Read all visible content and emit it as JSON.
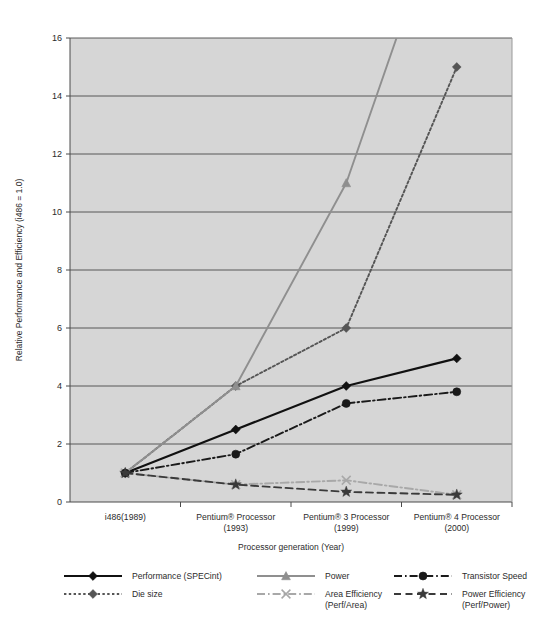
{
  "chart_data": {
    "type": "line",
    "title": "",
    "xlabel": "Processor generation (Year)",
    "ylabel": "Relative Performance and Efficiency (i486 = 1.0)",
    "categories": [
      "i486(1989)",
      "Pentium® Processor\n(1993)",
      "Pentium® 3 Processor\n(1999)",
      "Pentium® 4 Processor\n(2000)"
    ],
    "category_lines": [
      [
        "i486(1989)",
        ""
      ],
      [
        "Pentium® Processor",
        "(1993)"
      ],
      [
        "Pentium® 3 Processor",
        "(1999)"
      ],
      [
        "Pentium® 4 Processor",
        "(2000)"
      ]
    ],
    "ylim": [
      0,
      16
    ],
    "yticks": [
      0,
      2,
      4,
      6,
      8,
      10,
      12,
      14,
      16
    ],
    "grid": true,
    "legend_position": "bottom",
    "plot_background": "#d6d6d6",
    "series": [
      {
        "name": "Performance (SPECint)",
        "values": [
          1.0,
          2.5,
          4.0,
          4.95
        ],
        "color": "#111111",
        "style": "solid",
        "marker": "diamond"
      },
      {
        "name": "Die size",
        "values": [
          1.0,
          4.0,
          6.0,
          15.0
        ],
        "color": "#555555",
        "style": "dotted",
        "marker": "diamond"
      },
      {
        "name": "Power",
        "values": [
          1.0,
          4.0,
          11.0,
          22.0
        ],
        "color": "#8f8f8f",
        "style": "solid",
        "marker": "triangle"
      },
      {
        "name": "Area Efficiency (Perf/Area)",
        "label_lines": [
          "Area Efficiency",
          "(Perf/Area)"
        ],
        "values": [
          1.0,
          0.6,
          0.75,
          0.25
        ],
        "color": "#a8a8a8",
        "style": "dashdot",
        "marker": "x"
      },
      {
        "name": "Transistor Speed",
        "values": [
          1.0,
          1.65,
          3.4,
          3.8
        ],
        "color": "#1a1a1a",
        "style": "dashdot",
        "marker": "circle"
      },
      {
        "name": "Power Efficiency (Perf/Power)",
        "label_lines": [
          "Power Efficiency",
          "(Perf/Power)"
        ],
        "values": [
          1.0,
          0.6,
          0.35,
          0.25
        ],
        "color": "#3a3a3a",
        "style": "dashed",
        "marker": "star"
      }
    ]
  },
  "legend": {
    "items": [
      {
        "label": "Performance (SPECint)",
        "line2": ""
      },
      {
        "label": "Power",
        "line2": ""
      },
      {
        "label": "Transistor Speed",
        "line2": ""
      },
      {
        "label": "Die size",
        "line2": ""
      },
      {
        "label": "Area Efficiency",
        "line2": "(Perf/Area)"
      },
      {
        "label": "Power Efficiency",
        "line2": "(Perf/Power)"
      }
    ]
  },
  "axis": {
    "y_title": "Relative Performance and Efficiency (i486 = 1.0)",
    "x_title": "Processor generation (Year)",
    "ytick_0": "0",
    "ytick_2": "2",
    "ytick_4": "4",
    "ytick_6": "6",
    "ytick_8": "8",
    "ytick_10": "10",
    "ytick_12": "12",
    "ytick_14": "14",
    "ytick_16": "16"
  }
}
